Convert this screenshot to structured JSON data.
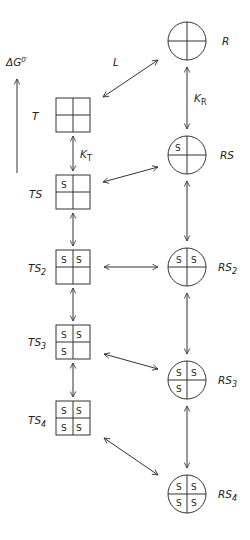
{
  "diagram": {
    "axis": {
      "label_main": "ΔG",
      "label_sup": "0′"
    },
    "t_states": [
      {
        "name": "T",
        "sub": "",
        "occupied": [
          false,
          false,
          false,
          false
        ]
      },
      {
        "name": "TS",
        "sub": "",
        "occupied": [
          true,
          false,
          false,
          false
        ]
      },
      {
        "name": "TS",
        "sub": "2",
        "occupied": [
          true,
          true,
          false,
          false
        ]
      },
      {
        "name": "TS",
        "sub": "3",
        "occupied": [
          true,
          true,
          true,
          false
        ]
      },
      {
        "name": "TS",
        "sub": "4",
        "occupied": [
          true,
          true,
          true,
          true
        ]
      }
    ],
    "r_states": [
      {
        "name": "R",
        "sub": "",
        "occupied": [
          false,
          false,
          false,
          false
        ]
      },
      {
        "name": "RS",
        "sub": "",
        "occupied": [
          true,
          false,
          false,
          false
        ]
      },
      {
        "name": "RS",
        "sub": "2",
        "occupied": [
          true,
          true,
          false,
          false
        ]
      },
      {
        "name": "RS",
        "sub": "3",
        "occupied": [
          true,
          true,
          true,
          false
        ]
      },
      {
        "name": "RS",
        "sub": "4",
        "occupied": [
          true,
          true,
          true,
          true
        ]
      }
    ],
    "site_label": "S",
    "constants": {
      "L": "L",
      "KT_main": "K",
      "KT_sub": "T",
      "KR_main": "K",
      "KR_sub": "R"
    }
  }
}
